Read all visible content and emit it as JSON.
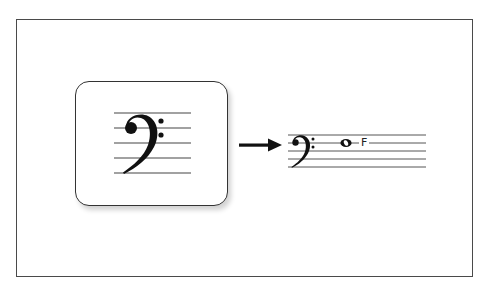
{
  "diagram": {
    "left_panel": {
      "symbol": "bass-clef",
      "staff_lines": 5
    },
    "connector": {
      "type": "arrow",
      "direction": "right"
    },
    "right_panel": {
      "symbol": "bass-clef",
      "staff_lines": 5,
      "note": {
        "type": "whole-note",
        "staff_position": "line-4-from-bottom",
        "label": "F"
      }
    },
    "colors": {
      "ink": "#222222",
      "frame": "#4a4a4a",
      "background": "#ffffff"
    }
  }
}
